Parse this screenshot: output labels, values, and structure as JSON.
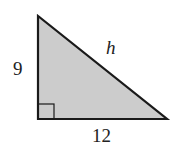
{
  "figure": {
    "type": "right-triangle",
    "fill_color": "#cccccc",
    "stroke_color": "#1a1a1a",
    "labels": {
      "vertical_leg": "9",
      "hypotenuse": "h",
      "horizontal_leg": "12"
    },
    "right_angle_marker": true
  }
}
